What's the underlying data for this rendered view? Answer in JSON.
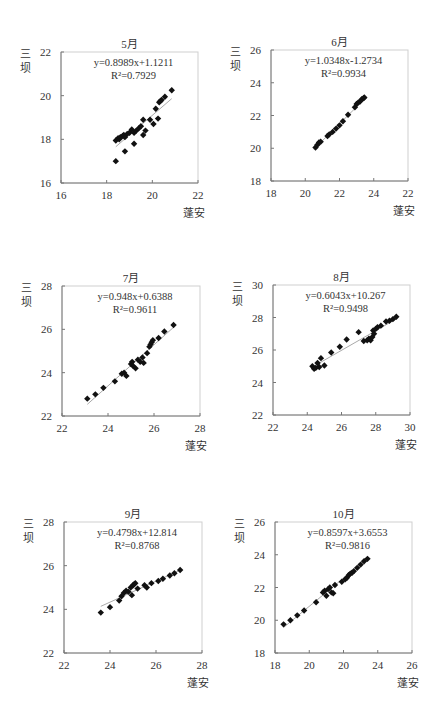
{
  "chart_data": [
    {
      "type": "scatter",
      "title": "5月",
      "xlabel": "蓬安",
      "ylabel": "三坝",
      "equation": "y=0.8989x+1.1211",
      "r2": "R²=0.7929",
      "slope": 0.8989,
      "intercept": 1.1211,
      "xlim": [
        16,
        22
      ],
      "ylim": [
        16,
        22
      ],
      "xticks": [
        "16",
        "18",
        "20",
        "22"
      ],
      "yticks": [
        "16",
        "18",
        "20",
        "22"
      ],
      "grid": false,
      "box": {
        "x0": 61,
        "y0": 52,
        "x1": 198,
        "y1": 183
      },
      "points": [
        [
          18.4,
          17.0
        ],
        [
          18.4,
          17.95
        ],
        [
          18.5,
          18.05
        ],
        [
          18.55,
          18.0
        ],
        [
          18.6,
          18.1
        ],
        [
          18.7,
          18.15
        ],
        [
          18.75,
          18.2
        ],
        [
          18.8,
          18.1
        ],
        [
          18.8,
          17.45
        ],
        [
          18.9,
          18.25
        ],
        [
          19.0,
          18.3
        ],
        [
          19.1,
          18.45
        ],
        [
          19.2,
          18.3
        ],
        [
          19.2,
          17.8
        ],
        [
          19.3,
          18.4
        ],
        [
          19.4,
          18.5
        ],
        [
          19.5,
          18.6
        ],
        [
          19.6,
          18.9
        ],
        [
          19.6,
          18.2
        ],
        [
          19.7,
          18.4
        ],
        [
          19.9,
          18.9
        ],
        [
          20.05,
          18.7
        ],
        [
          20.15,
          19.4
        ],
        [
          20.25,
          18.95
        ],
        [
          20.3,
          19.7
        ],
        [
          20.35,
          19.75
        ],
        [
          20.4,
          19.8
        ],
        [
          20.55,
          19.95
        ],
        [
          20.85,
          20.25
        ]
      ],
      "trend_x": [
        18.4,
        20.85
      ]
    },
    {
      "type": "scatter",
      "title": "6月",
      "xlabel": "蓬安",
      "ylabel": "三坝",
      "equation": "y=1.0348x-1.2734",
      "r2": "R²=0.9934",
      "slope": 1.0348,
      "intercept": -1.2734,
      "xlim": [
        18,
        26
      ],
      "ylim": [
        18,
        26
      ],
      "xticks": [
        "18",
        "20",
        "22",
        "24",
        "22"
      ],
      "yticks": [
        "18",
        "20",
        "22",
        "24",
        "26"
      ],
      "grid": false,
      "box": {
        "x0": 271,
        "y0": 50,
        "x1": 408,
        "y1": 181
      },
      "points": [
        [
          20.6,
          20.05
        ],
        [
          20.7,
          20.2
        ],
        [
          20.8,
          20.35
        ],
        [
          20.9,
          20.4
        ],
        [
          21.3,
          20.75
        ],
        [
          21.4,
          20.85
        ],
        [
          21.6,
          21.0
        ],
        [
          21.8,
          21.2
        ],
        [
          22.0,
          21.4
        ],
        [
          22.2,
          21.65
        ],
        [
          22.5,
          22.05
        ],
        [
          22.9,
          22.5
        ],
        [
          23.0,
          22.7
        ],
        [
          23.1,
          22.8
        ],
        [
          23.2,
          22.85
        ],
        [
          23.3,
          23.0
        ],
        [
          23.4,
          23.05
        ],
        [
          23.45,
          23.1
        ]
      ],
      "trend_x": [
        20.5,
        23.5
      ]
    },
    {
      "type": "scatter",
      "title": "7月",
      "xlabel": "蓬安",
      "ylabel": "三坝",
      "equation": "y=0.948x+0.6388",
      "r2": "R²=0.9611",
      "slope": 0.948,
      "intercept": 0.6388,
      "xlim": [
        22,
        28
      ],
      "ylim": [
        22,
        28
      ],
      "xticks": [
        "22",
        "24",
        "26",
        "28"
      ],
      "yticks": [
        "22",
        "24",
        "26",
        "28"
      ],
      "grid": false,
      "box": {
        "x0": 62,
        "y0": 286,
        "x1": 200,
        "y1": 416
      },
      "points": [
        [
          23.1,
          22.8
        ],
        [
          23.45,
          23.0
        ],
        [
          23.8,
          23.3
        ],
        [
          24.3,
          23.6
        ],
        [
          24.6,
          23.95
        ],
        [
          24.7,
          24.0
        ],
        [
          24.8,
          23.85
        ],
        [
          25.0,
          24.4
        ],
        [
          25.05,
          24.5
        ],
        [
          25.1,
          24.3
        ],
        [
          25.2,
          24.2
        ],
        [
          25.3,
          24.6
        ],
        [
          25.4,
          24.5
        ],
        [
          25.5,
          24.7
        ],
        [
          25.55,
          24.45
        ],
        [
          25.7,
          24.9
        ],
        [
          25.8,
          25.2
        ],
        [
          25.85,
          25.3
        ],
        [
          25.9,
          25.4
        ],
        [
          25.95,
          25.5
        ],
        [
          26.2,
          25.6
        ],
        [
          26.45,
          25.9
        ],
        [
          26.85,
          26.2
        ]
      ],
      "trend_x": [
        23.1,
        26.85
      ]
    },
    {
      "type": "scatter",
      "title": "8月",
      "xlabel": "蓬安",
      "ylabel": "三坝",
      "equation": "y=0.6043x+10.267",
      "r2": "R²=0.9498",
      "slope": 0.6043,
      "intercept": 10.267,
      "xlim": [
        22,
        30
      ],
      "ylim": [
        22,
        30
      ],
      "xticks": [
        "22",
        "24",
        "26",
        "28",
        "30"
      ],
      "yticks": [
        "22",
        "24",
        "26",
        "28",
        "30"
      ],
      "grid": false,
      "box": {
        "x0": 273,
        "y0": 285,
        "x1": 410,
        "y1": 415
      },
      "points": [
        [
          24.3,
          25.0
        ],
        [
          24.4,
          24.85
        ],
        [
          24.5,
          24.9
        ],
        [
          24.6,
          25.2
        ],
        [
          24.7,
          24.95
        ],
        [
          24.8,
          25.5
        ],
        [
          25.0,
          25.05
        ],
        [
          25.4,
          25.85
        ],
        [
          25.9,
          26.2
        ],
        [
          26.3,
          26.65
        ],
        [
          27.0,
          27.1
        ],
        [
          27.3,
          26.55
        ],
        [
          27.5,
          26.6
        ],
        [
          27.6,
          26.7
        ],
        [
          27.7,
          26.6
        ],
        [
          27.8,
          26.8
        ],
        [
          27.85,
          27.2
        ],
        [
          27.9,
          27.0
        ],
        [
          28.0,
          27.3
        ],
        [
          28.1,
          27.4
        ],
        [
          28.3,
          27.5
        ],
        [
          28.6,
          27.75
        ],
        [
          28.8,
          27.8
        ],
        [
          29.0,
          27.9
        ],
        [
          29.2,
          28.05
        ]
      ],
      "trend_x": [
        24.3,
        29.2
      ]
    },
    {
      "type": "scatter",
      "title": "9月",
      "xlabel": "蓬安",
      "ylabel": "三坝",
      "equation": "y=0.4798x+12.814",
      "r2": "R²=0.8768",
      "slope": 0.4798,
      "intercept": 12.814,
      "xlim": [
        22,
        28
      ],
      "ylim": [
        22,
        28
      ],
      "xticks": [
        "22",
        "24",
        "26",
        "28"
      ],
      "yticks": [
        "22",
        "24",
        "26",
        "28"
      ],
      "grid": false,
      "box": {
        "x0": 64,
        "y0": 522,
        "x1": 202,
        "y1": 653
      },
      "points": [
        [
          23.6,
          23.85
        ],
        [
          24.0,
          24.1
        ],
        [
          24.4,
          24.4
        ],
        [
          24.5,
          24.6
        ],
        [
          24.6,
          24.75
        ],
        [
          24.7,
          24.85
        ],
        [
          24.8,
          24.8
        ],
        [
          24.9,
          25.0
        ],
        [
          24.95,
          24.65
        ],
        [
          25.0,
          25.1
        ],
        [
          25.05,
          25.15
        ],
        [
          25.1,
          25.2
        ],
        [
          25.2,
          24.95
        ],
        [
          25.5,
          25.1
        ],
        [
          25.6,
          25.0
        ],
        [
          25.8,
          25.2
        ],
        [
          26.1,
          25.3
        ],
        [
          26.3,
          25.4
        ],
        [
          26.6,
          25.55
        ],
        [
          26.8,
          25.65
        ],
        [
          27.05,
          25.8
        ]
      ],
      "trend_x": [
        23.6,
        27.05
      ]
    },
    {
      "type": "scatter",
      "title": "10月",
      "xlabel": "蓬安",
      "ylabel": "三坝",
      "equation": "y=0.8597x+3.6553",
      "r2": "R²=0.9816",
      "slope": 0.8597,
      "intercept": 3.6553,
      "xlim": [
        18,
        26
      ],
      "ylim": [
        18,
        26
      ],
      "xticks": [
        "18",
        "20",
        "20",
        "24",
        "26"
      ],
      "yticks": [
        "18",
        "20",
        "22",
        "24",
        "26"
      ],
      "grid": false,
      "box": {
        "x0": 275,
        "y0": 522,
        "x1": 412,
        "y1": 653
      },
      "points": [
        [
          18.5,
          19.75
        ],
        [
          18.9,
          20.0
        ],
        [
          19.3,
          20.3
        ],
        [
          19.7,
          20.6
        ],
        [
          20.4,
          21.1
        ],
        [
          20.8,
          21.7
        ],
        [
          20.9,
          21.8
        ],
        [
          21.0,
          21.5
        ],
        [
          21.1,
          21.9
        ],
        [
          21.2,
          22.0
        ],
        [
          21.3,
          21.7
        ],
        [
          21.4,
          21.65
        ],
        [
          21.5,
          22.15
        ],
        [
          21.9,
          22.35
        ],
        [
          22.1,
          22.5
        ],
        [
          22.2,
          22.6
        ],
        [
          22.3,
          22.75
        ],
        [
          22.4,
          22.85
        ],
        [
          22.5,
          22.9
        ],
        [
          22.6,
          23.0
        ],
        [
          22.8,
          23.2
        ],
        [
          23.0,
          23.4
        ],
        [
          23.2,
          23.6
        ],
        [
          23.4,
          23.75
        ]
      ],
      "trend_x": [
        18.5,
        23.4
      ]
    }
  ]
}
